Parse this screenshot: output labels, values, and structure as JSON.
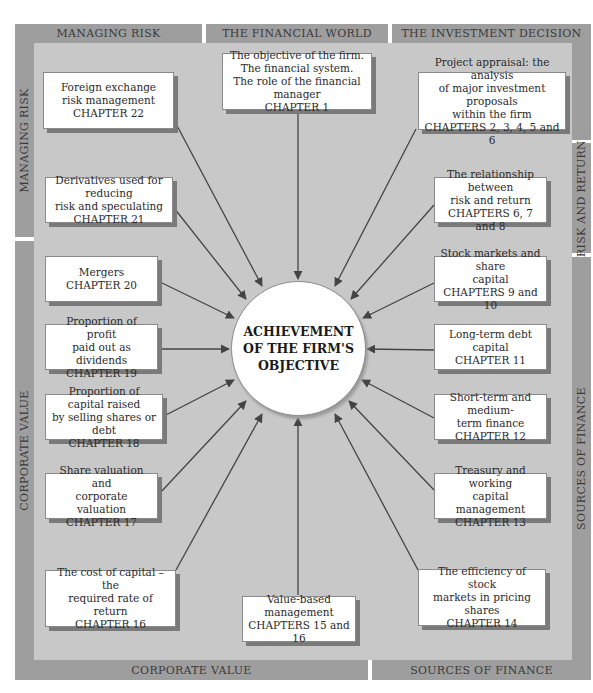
{
  "bands": {
    "top": [
      {
        "label": "MANAGING RISK"
      },
      {
        "label": "THE FINANCIAL WORLD"
      },
      {
        "label": "THE INVESTMENT DECISION"
      }
    ],
    "left": [
      {
        "label": "MANAGING RISK"
      },
      {
        "label": "CORPORATE VALUE"
      }
    ],
    "right": [
      {
        "label": ""
      },
      {
        "label": "RISK AND RETURN"
      },
      {
        "label": "SOURCES OF FINANCE"
      }
    ],
    "bottom": [
      {
        "label": "CORPORATE VALUE"
      },
      {
        "label": "SOURCES OF FINANCE"
      }
    ]
  },
  "center": {
    "lines": [
      "ACHIEVEMENT",
      "OF THE FIRM'S",
      "OBJECTIVE"
    ]
  },
  "boxes": [
    {
      "id": "ch1",
      "lines": [
        "The objective of the firm.",
        "The financial system.",
        "The role of the financial manager",
        "CHAPTER 1"
      ]
    },
    {
      "id": "ch2-6",
      "lines": [
        "Project appraisal: the analysis",
        "of major investment proposals",
        "within the firm",
        "CHAPTERS 2, 3, 4, 5 and 6"
      ]
    },
    {
      "id": "ch6-8",
      "lines": [
        "The relationship between",
        "risk and return",
        "CHAPTERS 6, 7 and 8"
      ]
    },
    {
      "id": "ch9-10",
      "lines": [
        "Stock markets and share",
        "capital",
        "CHAPTERS 9 and 10"
      ]
    },
    {
      "id": "ch11",
      "lines": [
        "Long-term debt capital",
        "CHAPTER 11"
      ]
    },
    {
      "id": "ch12",
      "lines": [
        "Short-term and medium-",
        "term finance",
        "CHAPTER 12"
      ]
    },
    {
      "id": "ch13",
      "lines": [
        "Treasury and working",
        "capital management",
        "CHAPTER 13"
      ]
    },
    {
      "id": "ch14",
      "lines": [
        "The efficiency of stock",
        "markets in pricing shares",
        "CHAPTER 14"
      ]
    },
    {
      "id": "ch15-16",
      "lines": [
        "Value-based management",
        "CHAPTERS 15 and 16"
      ]
    },
    {
      "id": "ch16",
      "lines": [
        "The cost of capital – the",
        "required rate of return",
        "CHAPTER 16"
      ]
    },
    {
      "id": "ch17",
      "lines": [
        "Share valuation and",
        "corporate valuation",
        "CHAPTER 17"
      ]
    },
    {
      "id": "ch18",
      "lines": [
        "Proportion of capital raised",
        "by selling shares or debt",
        "CHAPTER 18"
      ]
    },
    {
      "id": "ch19",
      "lines": [
        "Proportion of profit",
        "paid out as dividends",
        "CHAPTER 19"
      ]
    },
    {
      "id": "ch20",
      "lines": [
        "Mergers",
        "CHAPTER 20"
      ]
    },
    {
      "id": "ch21",
      "lines": [
        "Derivatives used for reducing",
        "risk and speculating",
        "CHAPTER 21"
      ]
    },
    {
      "id": "ch22",
      "lines": [
        "Foreign exchange",
        "risk management",
        "CHAPTER 22"
      ]
    }
  ],
  "colors": {
    "band": "#9e9e9e",
    "inner": "#c8c8c8",
    "box": "#ffffff",
    "arrow": "#444444"
  }
}
